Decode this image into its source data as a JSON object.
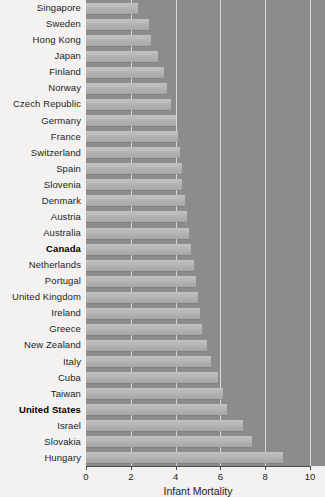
{
  "chart_data": {
    "type": "bar",
    "orientation": "horizontal",
    "title": "",
    "xlabel": "Infant Mortality",
    "ylabel": "",
    "xlim": [
      0,
      10
    ],
    "xticks": [
      0,
      2,
      4,
      6,
      8,
      10
    ],
    "xtick_labels": [
      "0",
      "2",
      "4",
      "6",
      "8",
      "10"
    ],
    "grid": true,
    "grid_axis": "x",
    "legend": null,
    "highlighted": [
      "Canada",
      "United States"
    ],
    "categories": [
      "Singapore",
      "Sweden",
      "Hong Kong",
      "Japan",
      "Finland",
      "Norway",
      "Czech Republic",
      "Germany",
      "France",
      "Switzerland",
      "Spain",
      "Slovenia",
      "Denmark",
      "Austria",
      "Australia",
      "Canada",
      "Netherlands",
      "Portugal",
      "United Kingdom",
      "Ireland",
      "Greece",
      "New Zealand",
      "Italy",
      "Cuba",
      "Taiwan",
      "United States",
      "Israel",
      "Slovakia",
      "Hungary"
    ],
    "values": [
      2.3,
      2.8,
      2.9,
      3.2,
      3.5,
      3.6,
      3.8,
      4.0,
      4.1,
      4.2,
      4.3,
      4.3,
      4.4,
      4.5,
      4.6,
      4.7,
      4.8,
      4.9,
      5.0,
      5.1,
      5.2,
      5.4,
      5.6,
      5.9,
      6.1,
      6.3,
      7.0,
      7.4,
      8.8
    ],
    "colors": {
      "plot_background": "#8e8e8e",
      "page_background": "#f3f2f0",
      "bar_fill": "#bab9b7",
      "gridline": "#e9e8e6",
      "axis": "#4a4a4a",
      "text": "#1d1d1d"
    }
  }
}
